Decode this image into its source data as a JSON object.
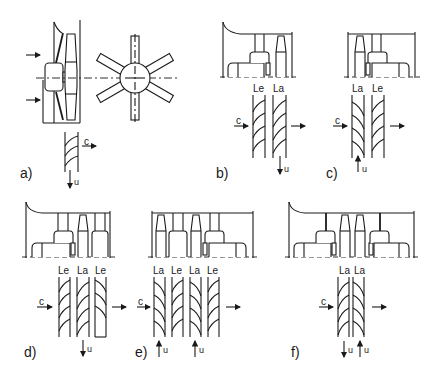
{
  "figure": {
    "panels": [
      {
        "id": "a",
        "label": "a)",
        "stages": [],
        "flow_label": "c",
        "velocity_labels": [
          "u"
        ],
        "description": "Axial fan with upstream housing and 6-blade impeller front view"
      },
      {
        "id": "b",
        "label": "b)",
        "stages": [
          "Le",
          "La"
        ],
        "flow_label": "c",
        "velocity_labels": [
          "u"
        ]
      },
      {
        "id": "c",
        "label": "c)",
        "stages": [
          "La",
          "Le"
        ],
        "flow_label": "c",
        "velocity_labels": [
          "u"
        ]
      },
      {
        "id": "d",
        "label": "d)",
        "stages": [
          "Le",
          "La",
          "Le"
        ],
        "flow_label": "c",
        "velocity_labels": [
          "u"
        ]
      },
      {
        "id": "e",
        "label": "e)",
        "stages": [
          "La",
          "Le",
          "La",
          "Le"
        ],
        "flow_label": "c",
        "velocity_labels": [
          "u",
          "u"
        ]
      },
      {
        "id": "f",
        "label": "f)",
        "stages": [
          "La",
          "La"
        ],
        "flow_label": "c",
        "velocity_labels": [
          "u",
          "u"
        ]
      }
    ]
  },
  "a": {
    "label": "a)",
    "c": "c",
    "u": "u"
  },
  "b": {
    "label": "b)",
    "c": "c",
    "u": "u",
    "s1": "Le",
    "s2": "La"
  },
  "c": {
    "label": "c)",
    "c": "c",
    "u": "u",
    "s1": "La",
    "s2": "Le"
  },
  "d": {
    "label": "d)",
    "c": "c",
    "u": "u",
    "s1": "Le",
    "s2": "La",
    "s3": "Le"
  },
  "e": {
    "label": "e)",
    "c": "c",
    "u1": "u",
    "u2": "u",
    "s1": "La",
    "s2": "Le",
    "s3": "La",
    "s4": "Le"
  },
  "f": {
    "label": "f)",
    "c": "c",
    "u1": "u",
    "u2": "u",
    "s1": "La",
    "s2": "La"
  }
}
